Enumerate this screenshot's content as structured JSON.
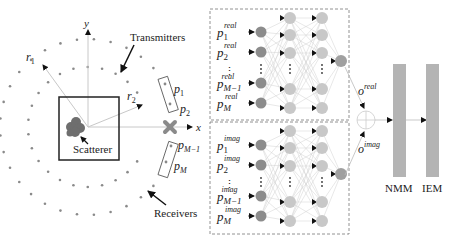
{
  "scene": {
    "axis_x_label": "x",
    "axis_y_label": "y",
    "r1_label": "r",
    "r1_sub": "1",
    "r2_label": "r",
    "r2_sub": "2",
    "transmitters_label": "Transmitters",
    "receivers_label": "Receivers",
    "scatterer_label": "Scatterer",
    "probes": [
      {
        "base": "p",
        "sub": "1"
      },
      {
        "base": "p",
        "sub": "2"
      },
      {
        "base": "p",
        "sub": "M−1"
      },
      {
        "base": "p",
        "sub": "M"
      }
    ]
  },
  "networks": {
    "real": {
      "superscript": "real",
      "inputs": [
        {
          "base": "p",
          "sub": "1"
        },
        {
          "base": "p",
          "sub": "2"
        },
        {
          "base": "p",
          "sub": "M−1"
        },
        {
          "base": "p",
          "sub": "M"
        }
      ],
      "output_base": "o",
      "output_sup": "real"
    },
    "imag": {
      "superscript": "imag",
      "inputs": [
        {
          "base": "p",
          "sub": "1"
        },
        {
          "base": "p",
          "sub": "2"
        },
        {
          "base": "p",
          "sub": "M−1"
        },
        {
          "base": "p",
          "sub": "M"
        }
      ],
      "output_base": "o",
      "output_sup": "imag"
    }
  },
  "blocks": {
    "nmm_label": "NMM",
    "iem_label": "IEM"
  },
  "colors": {
    "input_node": "#8c8c8c",
    "hidden_node": "#c8c8c8",
    "output_node": "#a0a0a0",
    "block": "#b4b4b4",
    "scatterer": "#6e6e6e",
    "marker": "#8a8a8a",
    "dots": "#8a8a8a"
  }
}
